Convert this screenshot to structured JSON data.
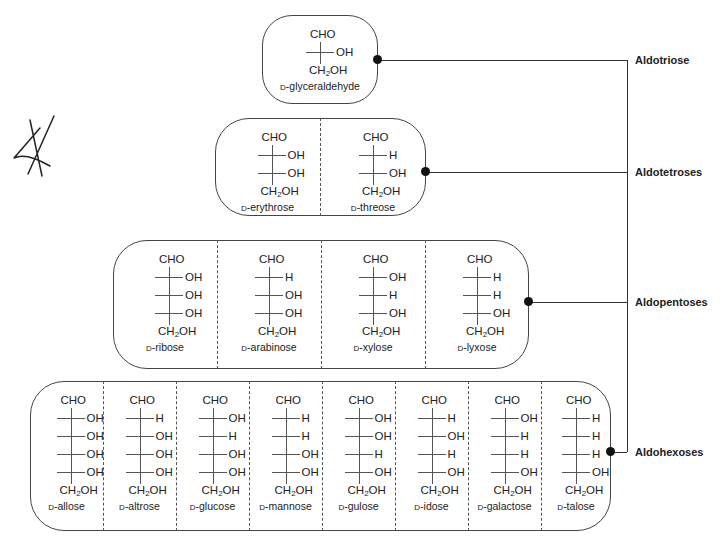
{
  "colors": {
    "line": "#333333",
    "text": "#222222",
    "background": "#ffffff"
  },
  "annotation": {
    "icon": "handwritten-scribble"
  },
  "groups": [
    {
      "id": "aldotriose",
      "label": "Aldotriose",
      "sugars": [
        {
          "name": "glyceraldehyde",
          "prefix": "D",
          "top": "CHO",
          "bottom": "CH2OH",
          "rows": [
            [
              "H",
              "OH"
            ]
          ]
        }
      ]
    },
    {
      "id": "aldotetroses",
      "label": "Aldotetroses",
      "sugars": [
        {
          "name": "erythrose",
          "prefix": "D",
          "top": "CHO",
          "bottom": "CH2OH",
          "rows": [
            [
              "H",
              "OH"
            ],
            [
              "H",
              "OH"
            ]
          ]
        },
        {
          "name": "threose",
          "prefix": "D",
          "top": "CHO",
          "bottom": "CH2OH",
          "rows": [
            [
              "HO",
              "H"
            ],
            [
              "H",
              "OH"
            ]
          ]
        }
      ]
    },
    {
      "id": "aldopentoses",
      "label": "Aldopentoses",
      "sugars": [
        {
          "name": "ribose",
          "prefix": "D",
          "top": "CHO",
          "bottom": "CH2OH",
          "rows": [
            [
              "H",
              "OH"
            ],
            [
              "H",
              "OH"
            ],
            [
              "H",
              "OH"
            ]
          ]
        },
        {
          "name": "arabinose",
          "prefix": "D",
          "top": "CHO",
          "bottom": "CH2OH",
          "rows": [
            [
              "HO",
              "H"
            ],
            [
              "H",
              "OH"
            ],
            [
              "H",
              "OH"
            ]
          ]
        },
        {
          "name": "xylose",
          "prefix": "D",
          "top": "CHO",
          "bottom": "CH2OH",
          "rows": [
            [
              "H",
              "OH"
            ],
            [
              "HO",
              "H"
            ],
            [
              "H",
              "OH"
            ]
          ]
        },
        {
          "name": "lyxose",
          "prefix": "D",
          "top": "CHO",
          "bottom": "CH2OH",
          "rows": [
            [
              "HO",
              "H"
            ],
            [
              "HO",
              "H"
            ],
            [
              "H",
              "OH"
            ]
          ]
        }
      ]
    },
    {
      "id": "aldohexoses",
      "label": "Aldohexoses",
      "sugars": [
        {
          "name": "allose",
          "prefix": "D",
          "top": "CHO",
          "bottom": "CH2OH",
          "rows": [
            [
              "H",
              "OH"
            ],
            [
              "H",
              "OH"
            ],
            [
              "H",
              "OH"
            ],
            [
              "H",
              "OH"
            ]
          ]
        },
        {
          "name": "altrose",
          "prefix": "D",
          "top": "CHO",
          "bottom": "CH2OH",
          "rows": [
            [
              "HO",
              "H"
            ],
            [
              "H",
              "OH"
            ],
            [
              "H",
              "OH"
            ],
            [
              "H",
              "OH"
            ]
          ]
        },
        {
          "name": "glucose",
          "prefix": "D",
          "top": "CHO",
          "bottom": "CH2OH",
          "rows": [
            [
              "H",
              "OH"
            ],
            [
              "HO",
              "H"
            ],
            [
              "H",
              "OH"
            ],
            [
              "H",
              "OH"
            ]
          ]
        },
        {
          "name": "mannose",
          "prefix": "D",
          "top": "CHO",
          "bottom": "CH2OH",
          "rows": [
            [
              "HO",
              "H"
            ],
            [
              "HO",
              "H"
            ],
            [
              "H",
              "OH"
            ],
            [
              "H",
              "OH"
            ]
          ]
        },
        {
          "name": "gulose",
          "prefix": "D",
          "top": "CHO",
          "bottom": "CH2OH",
          "rows": [
            [
              "H",
              "OH"
            ],
            [
              "H",
              "OH"
            ],
            [
              "HO",
              "H"
            ],
            [
              "H",
              "OH"
            ]
          ]
        },
        {
          "name": "idose",
          "prefix": "D",
          "top": "CHO",
          "bottom": "CH2OH",
          "rows": [
            [
              "HO",
              "H"
            ],
            [
              "H",
              "OH"
            ],
            [
              "HO",
              "H"
            ],
            [
              "H",
              "OH"
            ]
          ]
        },
        {
          "name": "galactose",
          "prefix": "D",
          "top": "CHO",
          "bottom": "CH2OH",
          "rows": [
            [
              "H",
              "OH"
            ],
            [
              "HO",
              "H"
            ],
            [
              "HO",
              "H"
            ],
            [
              "H",
              "OH"
            ]
          ]
        },
        {
          "name": "talose",
          "prefix": "D",
          "top": "CHO",
          "bottom": "CH2OH",
          "rows": [
            [
              "HO",
              "H"
            ],
            [
              "HO",
              "H"
            ],
            [
              "HO",
              "H"
            ],
            [
              "H",
              "OH"
            ]
          ]
        }
      ]
    }
  ]
}
